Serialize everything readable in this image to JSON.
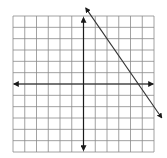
{
  "graph": {
    "type": "coordinate-plane",
    "grid": {
      "columns": 12,
      "rows": 12,
      "x_range": [
        -6,
        6
      ],
      "y_range": [
        -6,
        6
      ]
    },
    "axes": {
      "x_axis_arrows": true,
      "y_axis_arrows": true
    },
    "line": {
      "description": "straight line with arrows at both ends, negative slope",
      "approx_equation": "y = -1.5x + 7",
      "points": [
        [
          0.67,
          6
        ],
        [
          4.67,
          0
        ],
        [
          6,
          -2
        ]
      ]
    },
    "colors": {
      "grid": "#8a8a8a",
      "axes": "#1a1a1a",
      "line": "#333333",
      "background": "#ffffff"
    }
  }
}
